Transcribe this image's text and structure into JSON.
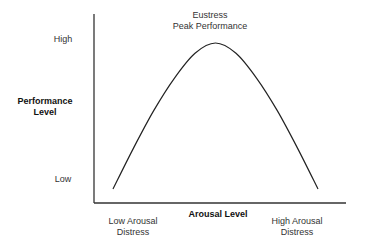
{
  "chart_data": {
    "type": "line",
    "title": "",
    "xlabel": "Arousal Level",
    "ylabel": "Performance Level",
    "y_ticks": [
      "Low",
      "High"
    ],
    "x_ticks": [
      "Low Arousal Distress",
      "High Arousal Distress"
    ],
    "annotations": [
      {
        "text": "Eustress Peak Performance",
        "x": 0.5,
        "y": 1.0
      }
    ],
    "grid": false,
    "legend": "none",
    "series": [
      {
        "name": "Performance curve (inverted U)",
        "x": [
          0.0,
          0.1,
          0.2,
          0.3,
          0.4,
          0.5,
          0.6,
          0.7,
          0.8,
          0.9,
          1.0
        ],
        "values": [
          0.0,
          0.28,
          0.54,
          0.76,
          0.93,
          1.0,
          0.93,
          0.76,
          0.54,
          0.28,
          0.0
        ]
      }
    ]
  },
  "labels": {
    "y_high": "High",
    "y_low": "Low",
    "ylabel_line1": "Performance",
    "ylabel_line2": "Level",
    "xlabel": "Arousal Level",
    "x_low_line1": "Low Arousal",
    "x_low_line2": "Distress",
    "x_high_line1": "High Arousal",
    "x_high_line2": "Distress",
    "peak_line1": "Eustress",
    "peak_line2": "Peak Performance"
  },
  "colors": {
    "line": "#222222",
    "axis": "#333333",
    "text": "#333333"
  }
}
